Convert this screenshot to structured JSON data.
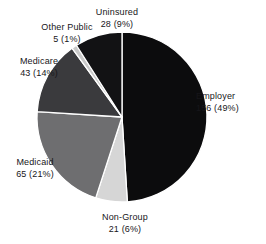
{
  "chart_data": {
    "type": "pie",
    "title": "",
    "subtitle": "",
    "xlabel": "",
    "ylabel": "",
    "legend_position": "none",
    "grid": false,
    "units": "millions of people",
    "total": 318,
    "categories": [
      "Employer",
      "Non-Group",
      "Medicaid",
      "Medicare",
      "Other Public",
      "Uninsured"
    ],
    "values": [
      156,
      21,
      65,
      43,
      5,
      28
    ],
    "percents": [
      49,
      6,
      21,
      14,
      1,
      9
    ],
    "colors": [
      "#0c0c0d",
      "#d6d6d6",
      "#6e6e70",
      "#3a3a3d",
      "#c9c9c9",
      "#121214"
    ],
    "start_angle_deg": 0,
    "direction": "clockwise",
    "slices": [
      {
        "name": "Employer",
        "value": 156,
        "percent": 49,
        "label_name": "Employer",
        "label_value": "156 (49%)",
        "color": "#0c0c0d"
      },
      {
        "name": "Non-Group",
        "value": 21,
        "percent": 6,
        "label_name": "Non-Group",
        "label_value": "21 (6%)",
        "color": "#d6d6d6"
      },
      {
        "name": "Medicaid",
        "value": 65,
        "percent": 21,
        "label_name": "Medicaid",
        "label_value": "65 (21%)",
        "color": "#6e6e70"
      },
      {
        "name": "Medicare",
        "value": 43,
        "percent": 14,
        "label_name": "Medicare",
        "label_value": "43 (14%)",
        "color": "#3a3a3d"
      },
      {
        "name": "Other Public",
        "value": 5,
        "percent": 1,
        "label_name": "Other Public",
        "label_value": "5 (1%)",
        "color": "#c9c9c9"
      },
      {
        "name": "Uninsured",
        "value": 28,
        "percent": 9,
        "label_name": "Uninsured",
        "label_value": "28 (9%)",
        "color": "#121214"
      }
    ]
  },
  "geometry": {
    "center_x": 122,
    "center_y": 117,
    "radius": 85,
    "separator_color": "#ffffff",
    "background": "#ffffff"
  }
}
